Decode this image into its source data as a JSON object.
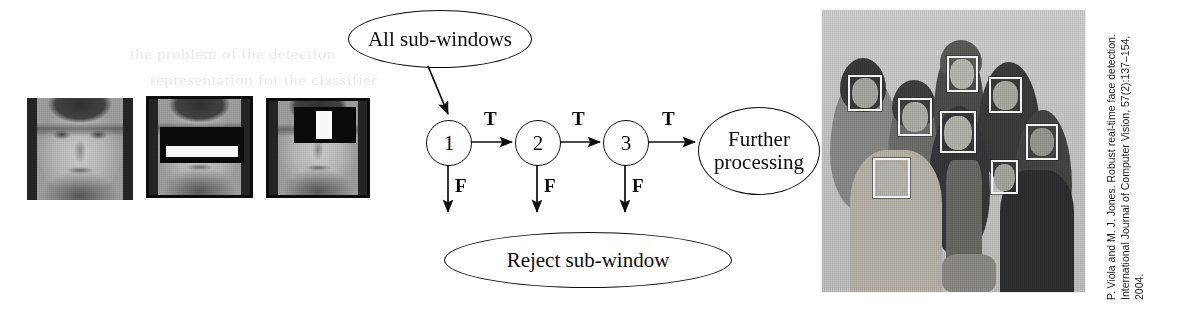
{
  "figure": {
    "background_color": "#ffffff",
    "ink_color": "#0d0d0d"
  },
  "thumbnails": {
    "caption_none": "",
    "items": [
      {
        "name": "plain-face",
        "feature": "none",
        "alt": "Low resolution grayscale face image"
      },
      {
        "name": "two-rectangle-feature-face",
        "feature": "two-rectangle-horizontal",
        "alt": "Face with horizontal two-rectangle Haar feature over the eye region"
      },
      {
        "name": "three-rectangle-feature-face",
        "feature": "three-rectangle-vertical",
        "alt": "Face with vertical three-rectangle Haar feature over the eye/nose bridge region"
      }
    ]
  },
  "cascade": {
    "input_label": "All sub-windows",
    "reject_label": "Reject sub-window",
    "output_label": "Further processing",
    "stages": [
      {
        "id": "1",
        "label": "1"
      },
      {
        "id": "2",
        "label": "2"
      },
      {
        "id": "3",
        "label": "3"
      }
    ],
    "true_label": "T",
    "false_label": "F",
    "true_edges": [
      "T",
      "T",
      "T"
    ],
    "false_edges": [
      "F",
      "F",
      "F"
    ]
  },
  "photo": {
    "alt": "Black and white group photograph of eight people with white face-detection bounding boxes",
    "detected_faces": 8,
    "box_color": "#f2f2f2",
    "boxes": [
      {
        "id": "face-1",
        "x": 26,
        "y": 65,
        "w": 34,
        "h": 36
      },
      {
        "id": "face-2",
        "x": 76,
        "y": 88,
        "w": 34,
        "h": 38
      },
      {
        "id": "face-3",
        "x": 125,
        "y": 46,
        "w": 31,
        "h": 36
      },
      {
        "id": "face-4",
        "x": 118,
        "y": 101,
        "w": 36,
        "h": 42
      },
      {
        "id": "face-5",
        "x": 167,
        "y": 67,
        "w": 33,
        "h": 36
      },
      {
        "id": "face-6",
        "x": 204,
        "y": 114,
        "w": 32,
        "h": 36
      },
      {
        "id": "face-7",
        "x": 169,
        "y": 150,
        "w": 27,
        "h": 34
      },
      {
        "id": "face-8",
        "x": 51,
        "y": 148,
        "w": 37,
        "h": 40
      }
    ]
  },
  "citation": {
    "line1": "P. Viola and M. J. Jones. Robust real-time face detection.",
    "line2": "International Journal of Computer Vision, 57(2):137–154,",
    "line3": "2004."
  },
  "ghost_text": {
    "line1": "the problem of the detection",
    "line2": "representation for the classifier"
  }
}
